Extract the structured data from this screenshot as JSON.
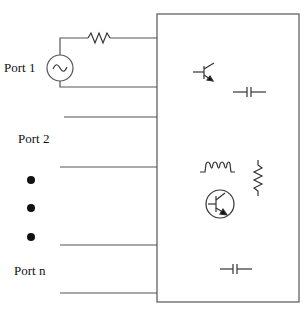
{
  "diagram": {
    "ports": [
      {
        "label": "Port 1",
        "has_source": true,
        "has_series_resistor": true
      },
      {
        "label": "Port 2"
      },
      {
        "label": "Port n"
      }
    ],
    "ellipsis": "vertical dots between Port 2 and Port n",
    "components_in_box": [
      "bjt-transistor",
      "capacitor",
      "inductor",
      "resistor-vertical",
      "bjt-transistor-circled",
      "capacitor"
    ],
    "colors": {
      "line": "#555555",
      "dot": "#111111",
      "text": "#111111"
    }
  }
}
